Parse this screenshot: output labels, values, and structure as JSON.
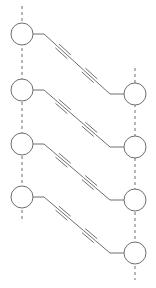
{
  "diagram": {
    "type": "ladder-chain",
    "colors": {
      "stroke": "#6e6e6e",
      "background": "#ffffff"
    },
    "left_nodes": [
      {
        "cx": 22,
        "cy": 34
      },
      {
        "cx": 22,
        "cy": 90
      },
      {
        "cx": 22,
        "cy": 144
      },
      {
        "cx": 22,
        "cy": 197
      }
    ],
    "right_nodes": [
      {
        "cx": 135,
        "cy": 94
      },
      {
        "cx": 135,
        "cy": 147
      },
      {
        "cx": 135,
        "cy": 200
      },
      {
        "cx": 135,
        "cy": 253
      }
    ],
    "node_radius": 11,
    "left_backbone": {
      "x": 22,
      "y_start": 6,
      "y_end": 222
    },
    "right_backbone": {
      "x": 135,
      "y_start": 68,
      "y_end": 280
    },
    "linker": "diyne"
  }
}
